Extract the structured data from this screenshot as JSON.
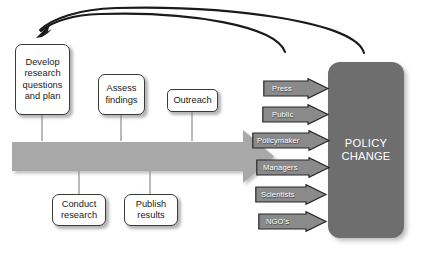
{
  "diagram": {
    "colors": {
      "background": "#ffffff",
      "main_arrow": "#a8a8a8",
      "policy_block": "#6e6e6e",
      "stakeholder_arrow": "#8a8a8a",
      "box_fill": "#ffffff",
      "box_border": "#3a3a3a",
      "connector_line": "#8c8c8c",
      "feedback_arrow": "#1a1a1a"
    },
    "process_arrow": {
      "name": "main-process-arrow",
      "direction": "left-to-right",
      "fill": "#a8a8a8"
    },
    "stages_above": [
      {
        "label": "Develop research questions and plan",
        "lines": [
          "Develop",
          "research",
          "questions",
          "and plan"
        ]
      },
      {
        "label": "Assess findings",
        "lines": [
          "Assess",
          "findings"
        ]
      },
      {
        "label": "Outreach",
        "lines": [
          "Outreach"
        ]
      }
    ],
    "stages_below": [
      {
        "label": "Conduct research",
        "lines": [
          "Conduct",
          "research"
        ]
      },
      {
        "label": "Publish results",
        "lines": [
          "Publish",
          "results"
        ]
      }
    ],
    "stakeholders": [
      {
        "label": "Press"
      },
      {
        "label": "Public"
      },
      {
        "label": "Policymaker"
      },
      {
        "label": "Managers"
      },
      {
        "label": "Scientists"
      },
      {
        "label": "NGO's"
      }
    ],
    "outcome": {
      "label": "POLICY CHANGE",
      "lines": [
        "POLICY",
        "CHANGE"
      ]
    },
    "feedback_arrows": [
      {
        "name": "feedback-arrow-inner",
        "from": "stakeholder-group",
        "to": "develop-research-box"
      },
      {
        "name": "feedback-arrow-outer",
        "from": "policy-change-block",
        "to": "develop-research-box"
      }
    ]
  }
}
